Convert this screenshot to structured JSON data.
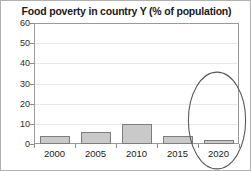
{
  "chart_data": {
    "type": "bar",
    "title": "Food poverty in country Y (% of population)",
    "xlabel": "",
    "ylabel": "",
    "categories": [
      "2000",
      "2005",
      "2010",
      "2015",
      "2020"
    ],
    "values": [
      4,
      6,
      10,
      4,
      2
    ],
    "ylim": [
      0,
      60
    ],
    "ytick_labels": [
      "0",
      "10",
      "20",
      "30",
      "40",
      "50",
      "60"
    ],
    "ytick_values": [
      0,
      10,
      20,
      30,
      40,
      50,
      60
    ],
    "grid": "horizontal",
    "legend": "none",
    "bar_color": "#c9c9c9",
    "bar_border_color": "#7d7d7d",
    "annotations": [
      {
        "name": "ellipse-highlight-2020",
        "shape": "ellipse",
        "target_category": "2020"
      }
    ]
  }
}
